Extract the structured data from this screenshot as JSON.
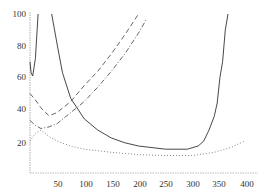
{
  "chart_data": {
    "type": "line",
    "title": "",
    "xlabel": "",
    "ylabel": "",
    "xlim": [
      0,
      410
    ],
    "ylim": [
      0,
      100
    ],
    "grid": false,
    "legend": null,
    "x_ticks": [
      "50",
      "100",
      "150",
      "200",
      "250",
      "300",
      "350",
      "400"
    ],
    "y_ticks": [
      "20",
      "40",
      "60",
      "80",
      "100"
    ],
    "series": [
      {
        "name": "solid",
        "style": "solid",
        "color": "#333333",
        "points": [
          [
            0,
            70
          ],
          [
            2,
            63
          ],
          [
            5,
            61
          ],
          [
            10,
            72
          ],
          [
            15,
            100
          ],
          [
            null,
            null
          ],
          [
            40,
            100
          ],
          [
            50,
            81
          ],
          [
            60,
            63
          ],
          [
            75,
            47
          ],
          [
            100,
            34
          ],
          [
            125,
            27
          ],
          [
            150,
            22
          ],
          [
            175,
            19
          ],
          [
            200,
            17
          ],
          [
            250,
            15
          ],
          [
            290,
            15
          ],
          [
            310,
            17
          ],
          [
            320,
            20
          ],
          [
            330,
            27
          ],
          [
            340,
            36
          ],
          [
            345,
            44
          ],
          [
            350,
            60
          ],
          [
            355,
            70
          ],
          [
            360,
            90
          ],
          [
            365,
            100
          ]
        ]
      },
      {
        "name": "dashed",
        "style": "dashed",
        "color": "#555555",
        "points": [
          [
            0,
            50
          ],
          [
            10,
            46
          ],
          [
            20,
            41
          ],
          [
            35,
            36
          ],
          [
            50,
            38
          ],
          [
            75,
            45
          ],
          [
            100,
            55
          ],
          [
            125,
            64
          ],
          [
            150,
            75
          ],
          [
            175,
            87
          ],
          [
            200,
            100
          ]
        ]
      },
      {
        "name": "dash-dot",
        "style": "dashdot",
        "color": "#555555",
        "points": [
          [
            0,
            33
          ],
          [
            10,
            30
          ],
          [
            20,
            28
          ],
          [
            35,
            29
          ],
          [
            50,
            31
          ],
          [
            75,
            38
          ],
          [
            100,
            45
          ],
          [
            125,
            54
          ],
          [
            150,
            64
          ],
          [
            175,
            75
          ],
          [
            200,
            88
          ],
          [
            215,
            97
          ]
        ]
      },
      {
        "name": "dotted",
        "style": "dotted",
        "color": "#777777",
        "points": [
          [
            0,
            20
          ],
          [
            10,
            25
          ],
          [
            20,
            27
          ],
          [
            35,
            23
          ],
          [
            50,
            20
          ],
          [
            75,
            17
          ],
          [
            100,
            15
          ],
          [
            150,
            13
          ],
          [
            200,
            11.5
          ],
          [
            250,
            11
          ],
          [
            300,
            11
          ],
          [
            340,
            13
          ],
          [
            370,
            16
          ],
          [
            395,
            20
          ]
        ]
      }
    ]
  }
}
